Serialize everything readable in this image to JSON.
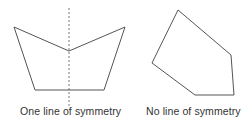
{
  "figures": [
    {
      "id": "symmetric-shape",
      "caption": "One line of symmetry",
      "points": [
        [
          14,
          27
        ],
        [
          69,
          51
        ],
        [
          125,
          27
        ],
        [
          104,
          90
        ],
        [
          35,
          90
        ]
      ],
      "symmetry_line": {
        "x": 69,
        "y1": 8,
        "y2": 106
      }
    },
    {
      "id": "asymmetric-shape",
      "caption": "No line of symmetry",
      "points": [
        [
          178,
          10
        ],
        [
          231,
          55
        ],
        [
          234,
          95
        ],
        [
          195,
          95
        ],
        [
          152,
          63
        ]
      ]
    }
  ],
  "colors": {
    "stroke": "#555555",
    "dash": "#777777",
    "text": "#333333"
  }
}
